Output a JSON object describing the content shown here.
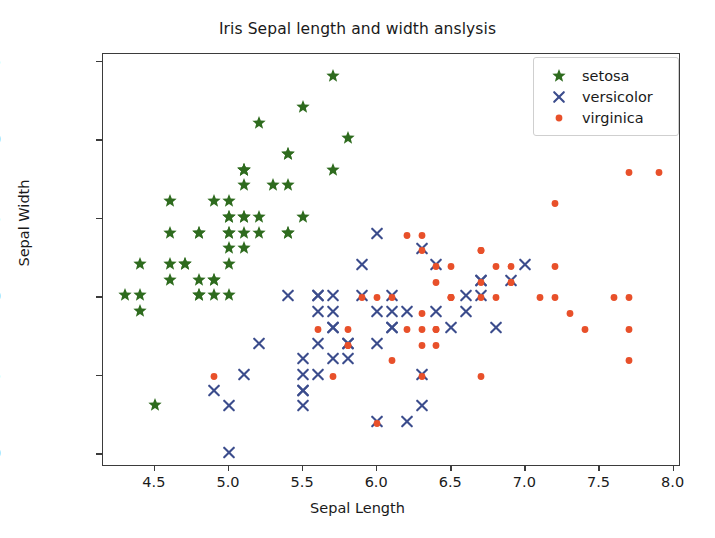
{
  "chart_data": {
    "type": "scatter",
    "title": "Iris Sepal length and width anslysis",
    "xlabel": "Sepal Length",
    "ylabel": "Sepal Width",
    "xlim": [
      4.15,
      8.05
    ],
    "ylim": [
      1.92,
      4.55
    ],
    "xticks": [
      "4.5",
      "5.0",
      "5.5",
      "6.0",
      "6.5",
      "7.0",
      "7.5",
      "8.0"
    ],
    "xtick_values": [
      4.5,
      5.0,
      5.5,
      6.0,
      6.5,
      7.0,
      7.5,
      8.0
    ],
    "yticks": [
      "2.0",
      "2.5",
      "3.0",
      "3.5",
      "4.0",
      "4.5"
    ],
    "ytick_values": [
      2.0,
      2.5,
      3.0,
      3.5,
      4.0,
      4.5
    ],
    "grid": false,
    "legend_position": "upper right",
    "series": [
      {
        "name": "setosa",
        "marker": "star",
        "color": "#2E6B1E",
        "points": [
          [
            5.1,
            3.5
          ],
          [
            4.9,
            3.0
          ],
          [
            4.7,
            3.2
          ],
          [
            4.6,
            3.1
          ],
          [
            5.0,
            3.6
          ],
          [
            5.4,
            3.9
          ],
          [
            4.6,
            3.4
          ],
          [
            5.0,
            3.4
          ],
          [
            4.4,
            2.9
          ],
          [
            4.9,
            3.1
          ],
          [
            5.4,
            3.7
          ],
          [
            4.8,
            3.4
          ],
          [
            4.8,
            3.0
          ],
          [
            4.3,
            3.0
          ],
          [
            5.8,
            4.0
          ],
          [
            5.7,
            4.4
          ],
          [
            5.4,
            3.9
          ],
          [
            5.1,
            3.5
          ],
          [
            5.7,
            3.8
          ],
          [
            5.1,
            3.8
          ],
          [
            5.4,
            3.4
          ],
          [
            5.1,
            3.7
          ],
          [
            4.6,
            3.6
          ],
          [
            5.1,
            3.3
          ],
          [
            4.8,
            3.4
          ],
          [
            5.0,
            3.0
          ],
          [
            5.0,
            3.4
          ],
          [
            5.2,
            3.5
          ],
          [
            5.2,
            3.4
          ],
          [
            4.7,
            3.2
          ],
          [
            4.8,
            3.1
          ],
          [
            5.4,
            3.4
          ],
          [
            5.2,
            4.1
          ],
          [
            5.5,
            4.2
          ],
          [
            4.9,
            3.1
          ],
          [
            5.0,
            3.2
          ],
          [
            5.5,
            3.5
          ],
          [
            4.9,
            3.6
          ],
          [
            4.4,
            3.0
          ],
          [
            5.1,
            3.4
          ],
          [
            5.0,
            3.5
          ],
          [
            4.5,
            2.3
          ],
          [
            4.4,
            3.2
          ],
          [
            5.0,
            3.5
          ],
          [
            5.1,
            3.8
          ],
          [
            4.8,
            3.0
          ],
          [
            5.1,
            3.8
          ],
          [
            4.6,
            3.2
          ],
          [
            5.3,
            3.7
          ],
          [
            5.0,
            3.3
          ]
        ]
      },
      {
        "name": "versicolor",
        "marker": "x",
        "color": "#3B4C8C",
        "points": [
          [
            7.0,
            3.2
          ],
          [
            6.4,
            3.2
          ],
          [
            6.9,
            3.1
          ],
          [
            5.5,
            2.3
          ],
          [
            6.5,
            2.8
          ],
          [
            5.7,
            2.8
          ],
          [
            6.3,
            3.3
          ],
          [
            4.9,
            2.4
          ],
          [
            6.6,
            2.9
          ],
          [
            5.2,
            2.7
          ],
          [
            5.0,
            2.0
          ],
          [
            5.9,
            3.0
          ],
          [
            6.0,
            2.2
          ],
          [
            6.1,
            2.9
          ],
          [
            5.6,
            2.9
          ],
          [
            6.7,
            3.1
          ],
          [
            5.6,
            3.0
          ],
          [
            5.8,
            2.7
          ],
          [
            6.2,
            2.2
          ],
          [
            5.6,
            2.5
          ],
          [
            5.9,
            3.2
          ],
          [
            6.1,
            2.8
          ],
          [
            6.3,
            2.5
          ],
          [
            6.1,
            2.8
          ],
          [
            6.4,
            2.9
          ],
          [
            6.6,
            3.0
          ],
          [
            6.8,
            2.8
          ],
          [
            6.7,
            3.0
          ],
          [
            6.0,
            2.9
          ],
          [
            5.7,
            2.6
          ],
          [
            5.5,
            2.4
          ],
          [
            5.5,
            2.4
          ],
          [
            5.8,
            2.7
          ],
          [
            6.0,
            2.7
          ],
          [
            5.4,
            3.0
          ],
          [
            6.0,
            3.4
          ],
          [
            6.7,
            3.1
          ],
          [
            6.3,
            2.3
          ],
          [
            5.6,
            3.0
          ],
          [
            5.5,
            2.5
          ],
          [
            5.5,
            2.6
          ],
          [
            6.1,
            3.0
          ],
          [
            5.8,
            2.6
          ],
          [
            5.0,
            2.3
          ],
          [
            5.6,
            2.7
          ],
          [
            5.7,
            3.0
          ],
          [
            5.7,
            2.9
          ],
          [
            6.2,
            2.9
          ],
          [
            5.1,
            2.5
          ],
          [
            5.7,
            2.8
          ]
        ]
      },
      {
        "name": "virginica",
        "marker": "dot",
        "color": "#E8502A",
        "points": [
          [
            6.3,
            3.3
          ],
          [
            5.8,
            2.7
          ],
          [
            7.1,
            3.0
          ],
          [
            6.3,
            2.9
          ],
          [
            6.5,
            3.0
          ],
          [
            7.6,
            3.0
          ],
          [
            4.9,
            2.5
          ],
          [
            7.3,
            2.9
          ],
          [
            6.7,
            2.5
          ],
          [
            7.2,
            3.6
          ],
          [
            6.5,
            3.2
          ],
          [
            6.4,
            2.7
          ],
          [
            6.8,
            3.0
          ],
          [
            5.7,
            2.5
          ],
          [
            5.8,
            2.8
          ],
          [
            6.4,
            3.2
          ],
          [
            6.5,
            3.0
          ],
          [
            7.7,
            3.8
          ],
          [
            7.7,
            2.6
          ],
          [
            6.0,
            2.2
          ],
          [
            6.9,
            3.2
          ],
          [
            5.6,
            2.8
          ],
          [
            7.7,
            2.8
          ],
          [
            6.3,
            2.7
          ],
          [
            6.7,
            3.3
          ],
          [
            7.2,
            3.2
          ],
          [
            6.2,
            2.8
          ],
          [
            6.1,
            3.0
          ],
          [
            6.4,
            2.8
          ],
          [
            7.2,
            3.0
          ],
          [
            7.4,
            2.8
          ],
          [
            7.9,
            3.8
          ],
          [
            6.4,
            2.8
          ],
          [
            6.3,
            2.8
          ],
          [
            6.1,
            2.6
          ],
          [
            7.7,
            3.0
          ],
          [
            6.3,
            3.4
          ],
          [
            6.4,
            3.1
          ],
          [
            6.0,
            3.0
          ],
          [
            6.9,
            3.1
          ],
          [
            6.7,
            3.1
          ],
          [
            6.9,
            3.1
          ],
          [
            5.8,
            2.7
          ],
          [
            6.8,
            3.2
          ],
          [
            6.7,
            3.3
          ],
          [
            6.7,
            3.0
          ],
          [
            6.3,
            2.5
          ],
          [
            6.5,
            3.0
          ],
          [
            6.2,
            3.4
          ],
          [
            5.9,
            3.0
          ]
        ]
      }
    ]
  },
  "legend": {
    "entries": [
      {
        "label": "setosa",
        "glyph": "star-marker",
        "color": "#2E6B1E"
      },
      {
        "label": "versicolor",
        "glyph": "x-marker",
        "color": "#3B4C8C"
      },
      {
        "label": "virginica",
        "glyph": "dot-marker",
        "color": "#E8502A"
      }
    ]
  }
}
